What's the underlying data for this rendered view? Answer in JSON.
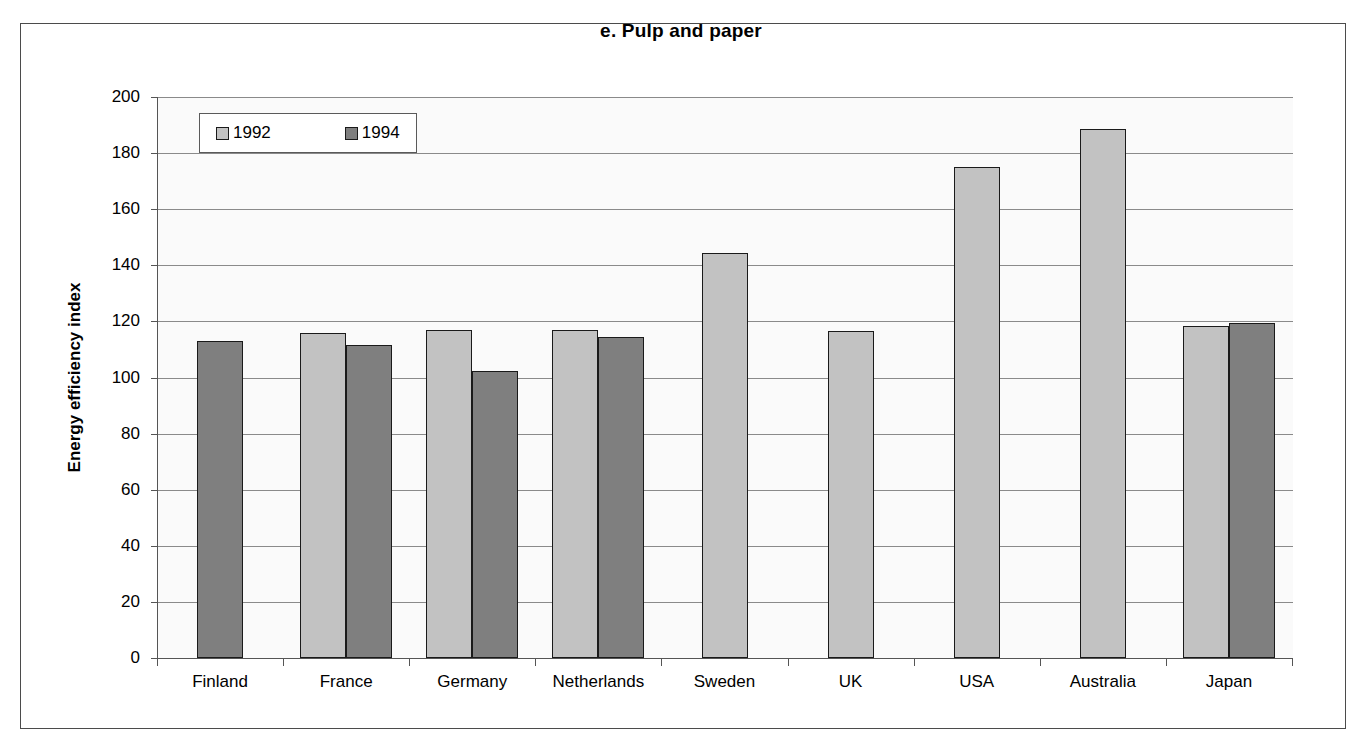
{
  "chart_data": {
    "type": "bar",
    "title": "e. Pulp and paper",
    "xlabel": "",
    "ylabel": "Energy efficiency index",
    "ylim": [
      0,
      200
    ],
    "ytick_step": 20,
    "yticks": [
      0,
      20,
      40,
      60,
      80,
      100,
      120,
      140,
      160,
      180,
      200
    ],
    "grid": true,
    "legend_position": "top-left-inside",
    "categories": [
      "Finland",
      "France",
      "Germany",
      "Netherlands",
      "Sweden",
      "UK",
      "USA",
      "Australia",
      "Japan"
    ],
    "series": [
      {
        "name": "1992",
        "color": "#c2c2c2",
        "values": [
          null,
          116.0,
          117.0,
          117.0,
          144.5,
          116.5,
          175.0,
          188.5,
          118.5
        ]
      },
      {
        "name": "1994",
        "color": "#7f7f7f",
        "values": [
          113.0,
          111.5,
          102.5,
          114.5,
          null,
          null,
          null,
          null,
          119.5
        ]
      }
    ]
  },
  "legend": {
    "entries": [
      {
        "label": "1992",
        "swatch": "legend-swatch-1992"
      },
      {
        "label": "1994",
        "swatch": "legend-swatch-1994"
      }
    ]
  },
  "colors": {
    "series_1992": "#c2c2c2",
    "series_1994": "#7f7f7f",
    "bar_outline": "#1a1a1a",
    "gridline": "#8a8a8a",
    "axis": "#555555",
    "frame": "#4b4b4b",
    "plot_background": "#fafafa",
    "page_background": "#ffffff"
  }
}
